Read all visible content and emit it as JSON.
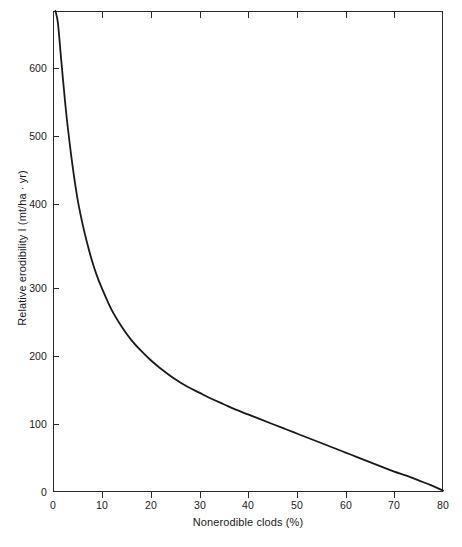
{
  "chart_data": {
    "type": "line",
    "title": "",
    "subtitle": "",
    "xlabel": "Nonerodible clods (%)",
    "ylabel": "Relative erodibility I (mt/ha · yr)",
    "xlim": [
      0,
      80
    ],
    "ylim": [
      0,
      707
    ],
    "grid": false,
    "legend": null,
    "legend_position": "none",
    "xticks": [
      0,
      10,
      20,
      30,
      40,
      50,
      60,
      70,
      80
    ],
    "xtick_labels": [
      "0",
      "10",
      "20",
      "30",
      "40",
      "50",
      "60",
      "70",
      "80"
    ],
    "yticks": [
      0,
      100,
      200,
      300,
      400,
      500,
      600
    ],
    "ytick_labels": [
      "0",
      "100",
      "200",
      "300",
      "400",
      "500",
      "600"
    ],
    "series": [
      {
        "name": "Relative erodibility",
        "color": "#1a1a1a",
        "line_width": 1.8,
        "x": [
          0.5,
          1,
          1.5,
          2,
          2.5,
          3,
          4,
          5,
          6,
          7,
          8,
          9,
          10,
          12,
          14,
          16,
          18,
          20,
          22,
          25,
          27.5,
          30,
          32.5,
          35,
          37.5,
          40,
          42.5,
          45,
          47.5,
          50,
          52.5,
          55,
          57.5,
          60,
          62.5,
          65,
          67.5,
          70,
          72.5,
          75,
          77.5,
          80
        ],
        "y": [
          707,
          690,
          650,
          610,
          572,
          538,
          480,
          432,
          396,
          366,
          340,
          318,
          300,
          268,
          244,
          224,
          208,
          194,
          182,
          166,
          155,
          146,
          137,
          129,
          121,
          114,
          107,
          100,
          93,
          86,
          79,
          72,
          65,
          58,
          51,
          44,
          37,
          30,
          24,
          17,
          10,
          2
        ]
      }
    ]
  },
  "axis": {
    "x_title": "Nonerodible clods (%)",
    "y_title": "Relative erodibility I (mt/ha · yr)",
    "x_tick_labels": [
      "0",
      "10",
      "20",
      "30",
      "40",
      "50",
      "60",
      "70",
      "80"
    ],
    "y_tick_labels": [
      "600",
      "500",
      "400",
      "300",
      "200",
      "100",
      "0"
    ]
  },
  "figure": {
    "caption": ""
  },
  "colors": {
    "curve": "#1a1a1a",
    "frame": "#2b2b2b",
    "background": "#ffffff"
  }
}
